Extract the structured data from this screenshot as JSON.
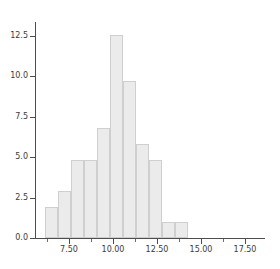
{
  "chart_data": {
    "type": "bar",
    "title": "",
    "subtitle": "",
    "xlabel": "",
    "ylabel": "",
    "grid": false,
    "legend": "none",
    "orientation": "vertical",
    "bar_style": "histogram",
    "xlim": [
      5.1,
      18.2
    ],
    "ylim": [
      0,
      13.8
    ],
    "bin_width": 0.74,
    "x_tick_labels": [
      "7.50",
      "10.00",
      "12.50",
      "15.00",
      "17.50"
    ],
    "x_tick_values": [
      7.5,
      10.0,
      12.5,
      15.0,
      17.5
    ],
    "x_minor_tick_values": [
      6.25,
      8.75,
      11.25,
      13.75,
      16.25
    ],
    "y_tick_labels": [
      "0.0",
      "2.5",
      "5.0",
      "7.5",
      "10.0",
      "12.5"
    ],
    "y_tick_values": [
      0.0,
      2.5,
      5.0,
      7.5,
      10.0,
      12.5
    ],
    "bin_starts": [
      6.17,
      6.91,
      7.65,
      8.39,
      9.13,
      9.87,
      10.61,
      11.35,
      12.09,
      12.83,
      13.57
    ],
    "bin_ends": [
      6.91,
      7.65,
      8.39,
      9.13,
      9.87,
      10.61,
      11.35,
      12.09,
      12.83,
      13.57,
      14.31
    ],
    "categories": [
      "6.2-6.9",
      "6.9-7.7",
      "7.7-8.4",
      "8.4-9.1",
      "9.1-9.9",
      "9.9-10.6",
      "10.6-11.4",
      "11.4-12.1",
      "12.1-12.8",
      "12.8-13.6",
      "13.6-14.3"
    ],
    "values": [
      2,
      3,
      5,
      5,
      7,
      13,
      10,
      6,
      5,
      1,
      1
    ],
    "colors": {
      "bar_fill": "#ebebeb",
      "bar_edge": "#cfcfcf",
      "axis": "#4d4d4d",
      "tick_label": "#3a3a3a",
      "background": "#ffffff"
    }
  }
}
